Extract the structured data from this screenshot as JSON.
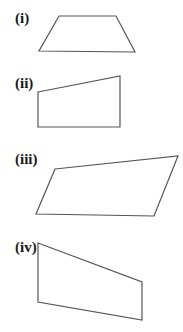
{
  "figures": [
    {
      "label": "(i)",
      "label_pos": [
        15,
        23
      ],
      "shape": "trapezium",
      "points": "59,16 116,16 135,52 39,51"
    },
    {
      "label": "(ii)",
      "label_pos": [
        15,
        88
      ],
      "shape": "right-trapezium",
      "points": "38,92 120,76 120,127 38,127"
    },
    {
      "label": "(iii)",
      "label_pos": [
        15,
        164
      ],
      "shape": "quadrilateral",
      "points": "55,169 178,156 154,216 36,214"
    },
    {
      "label": "(iv)",
      "label_pos": [
        15,
        252
      ],
      "shape": "trapezium",
      "points": "38,243 142,282 142,320 38,302"
    }
  ],
  "colors": {
    "stroke": "#555555",
    "label": "#1a1a1a",
    "background": "#ffffff"
  }
}
